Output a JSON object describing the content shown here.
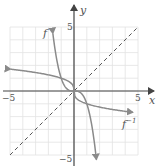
{
  "chart_data": {
    "type": "line",
    "title": "",
    "xlabel": "x",
    "ylabel": "y",
    "xlim": [
      -5,
      5
    ],
    "ylim": [
      -5,
      5
    ],
    "grid": true,
    "tick_labels": {
      "x": [
        "-5",
        "5"
      ],
      "y": [
        "5",
        "-5"
      ]
    },
    "series": [
      {
        "name": "f",
        "label": "f",
        "formula": "y = -x^3",
        "style": "solid",
        "arrows": "both"
      },
      {
        "name": "f_inverse",
        "label": "f⁻¹",
        "formula": "y = -cbrt(x)",
        "style": "solid",
        "arrows": "both"
      },
      {
        "name": "identity",
        "label": "",
        "formula": "y = x",
        "style": "dashed",
        "arrows": "none"
      }
    ]
  },
  "labels": {
    "x_axis": "x",
    "y_axis": "y",
    "x_min": "−5",
    "x_max": "5",
    "y_max": "5",
    "y_min": "−5",
    "f": "f",
    "f_inv_base": "f",
    "f_inv_sup": "−1"
  },
  "colors": {
    "grid": "#e2e2e2",
    "axes": "#444444",
    "curves": "#8a8a8a",
    "dashed": "#555555",
    "text": "#555555"
  }
}
